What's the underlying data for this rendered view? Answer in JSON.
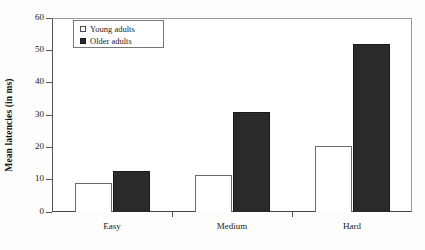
{
  "chart_data": {
    "type": "bar",
    "title": "",
    "subtitle": "",
    "xlabel": "",
    "ylabel": "Mean latencies (in ms)",
    "categories": [
      "Easy",
      "Medium",
      "Hard"
    ],
    "series": [
      {
        "name": "Young adults",
        "values": [
          9,
          11.5,
          20.4
        ],
        "color": "#ffffff",
        "swatch": "open-square"
      },
      {
        "name": "Older adults",
        "values": [
          12.7,
          30.8,
          52
        ],
        "color": "#2a2a2a",
        "swatch": "filled-square"
      }
    ],
    "ylim": [
      0,
      60
    ],
    "yticks": [
      0,
      10,
      20,
      30,
      40,
      50,
      60
    ],
    "ytick_labels": [
      "0",
      "10",
      "20",
      "30",
      "40",
      "50",
      "60"
    ],
    "grid": false,
    "legend_position": "top-left-inside",
    "legend_entries": [
      "Young adults",
      "Older adults"
    ]
  },
  "axes": {
    "y_title": "Mean latencies (in ms)"
  },
  "legend": {
    "entries": [
      {
        "label": "Young adults",
        "swatch": "open-square"
      },
      {
        "label": "Older adults",
        "swatch": "filled-square"
      }
    ]
  }
}
